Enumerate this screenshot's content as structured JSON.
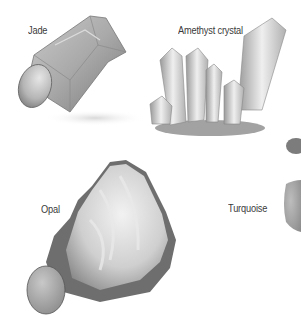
{
  "illustration": {
    "gems": [
      {
        "name": "Jade",
        "label_pos": [
          28,
          24
        ]
      },
      {
        "name": "Amethyst crystal",
        "label_pos": [
          178,
          24
        ]
      },
      {
        "name": "Opal",
        "label_pos": [
          41,
          203
        ]
      },
      {
        "name": "Turquoise",
        "label_pos": [
          228,
          202
        ]
      }
    ]
  }
}
